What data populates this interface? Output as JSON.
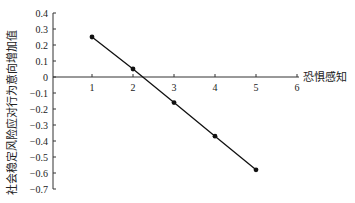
{
  "chart_data": {
    "type": "line",
    "title": "",
    "xlabel": "恐惧感知",
    "ylabel": "社会稳定风险应对行为意向增加值",
    "x": [
      1,
      2,
      3,
      4,
      5
    ],
    "series": [
      {
        "name": "增加值",
        "values": [
          0.25,
          0.05,
          -0.16,
          -0.37,
          -0.58
        ]
      }
    ],
    "xlim": [
      0,
      6
    ],
    "ylim": [
      -0.7,
      0.4
    ],
    "xticks": [
      "1",
      "2",
      "3",
      "4",
      "5",
      "6"
    ],
    "yticks": [
      "0.4",
      "0.3",
      "0.2",
      "0.1",
      "0",
      "-0.1",
      "-0.2",
      "-0.3",
      "-0.4",
      "-0.5",
      "-0.6",
      "-0.7"
    ],
    "grid": false,
    "legend": "none",
    "colors": {
      "line": "#111111",
      "axis": "#333333"
    }
  }
}
